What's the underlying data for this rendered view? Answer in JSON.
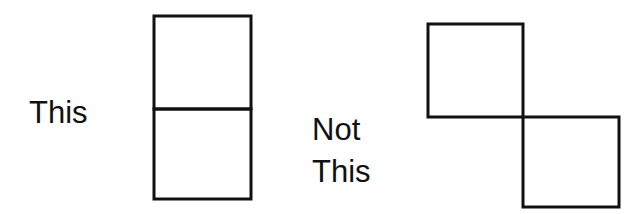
{
  "correct_example": {
    "label": "This",
    "description": "two boxes stacked vertically sharing a full edge"
  },
  "incorrect_example": {
    "label_line1": "Not",
    "label_line2": "This",
    "description": "two boxes touching only at a corner, offset diagonally"
  },
  "colors": {
    "stroke": "#111111",
    "background": "#ffffff"
  }
}
